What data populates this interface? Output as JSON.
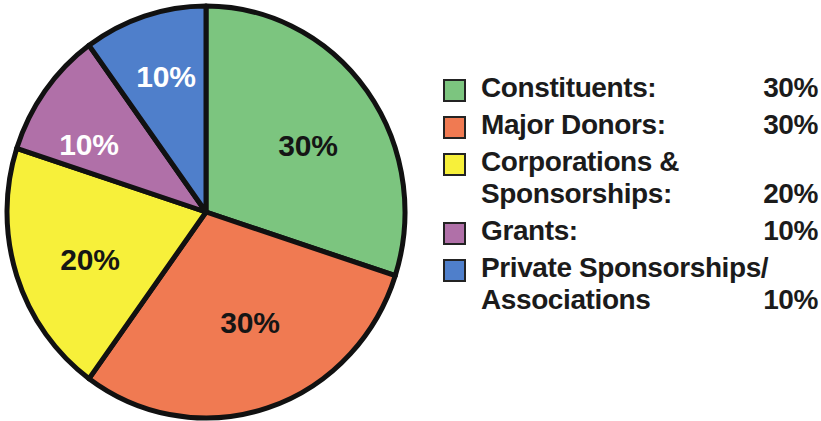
{
  "chart_data": {
    "type": "pie",
    "title": "",
    "subtitle": "",
    "xlabel": "",
    "ylabel": "",
    "grid": false,
    "legend_position": "right",
    "start_angle_deg": 0,
    "direction": "clockwise",
    "units": "%",
    "categories": [
      "Constituents:",
      "Major Donors:",
      "Corporations &\nSponsorships:",
      "Grants:",
      "Private Sponsorships/\nAssociations"
    ],
    "values": [
      30,
      30,
      20,
      10,
      10
    ],
    "data_labels": [
      "30%",
      "30%",
      "20%",
      "10%",
      "10%"
    ],
    "colors": [
      "#7CC57F",
      "#F07A52",
      "#F7F03A",
      "#B070A8",
      "#4F7FCB"
    ],
    "slices": [
      {
        "name": "Constituents:",
        "value": 30,
        "label": "30%",
        "color": "#7CC57F",
        "label_color": "#151515",
        "start_deg": 0,
        "end_deg": 108,
        "label_x": 308,
        "label_y": 148
      },
      {
        "name": "Major Donors:",
        "value": 30,
        "label": "30%",
        "color": "#F07A52",
        "label_color": "#151515",
        "start_deg": 108,
        "end_deg": 216,
        "label_x": 250,
        "label_y": 325
      },
      {
        "name": "Corporations & Sponsorships:",
        "value": 20,
        "label": "20%",
        "color": "#F7F03A",
        "label_color": "#151515",
        "start_deg": 216,
        "end_deg": 288,
        "label_x": 90,
        "label_y": 262
      },
      {
        "name": "Grants:",
        "value": 10,
        "label": "10%",
        "color": "#B070A8",
        "label_color": "#FFFFFF",
        "start_deg": 288,
        "end_deg": 324,
        "label_x": 89,
        "label_y": 147
      },
      {
        "name": "Private Sponsorships/Associations",
        "value": 10,
        "label": "10%",
        "color": "#4F7FCB",
        "label_color": "#FFFFFF",
        "start_deg": 324,
        "end_deg": 360,
        "label_x": 166,
        "label_y": 79
      }
    ],
    "geometry": {
      "center_x": 206,
      "center_y": 212,
      "radius_x": 199,
      "radius_y": 206,
      "outline_color": "#111111"
    }
  },
  "legend": {
    "rows": [
      {
        "swatch_color": "#7CC57F",
        "label": "Constituents:",
        "value": "30%"
      },
      {
        "swatch_color": "#F07A52",
        "label": "Major Donors:",
        "value": "30%"
      },
      {
        "swatch_color": "#F7F03A",
        "label": "Corporations &\nSponsorships:",
        "value": "20%"
      },
      {
        "swatch_color": "#B070A8",
        "label": "Grants:",
        "value": "10%"
      },
      {
        "swatch_color": "#4F7FCB",
        "label": "Private Sponsorships/\nAssociations",
        "value": "10%"
      }
    ]
  }
}
